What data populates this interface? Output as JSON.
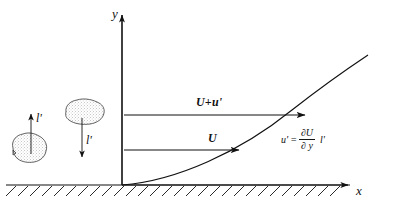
{
  "figure": {
    "background_color": "#ffffff",
    "line_color": "#111111",
    "axes": {
      "y_label": "y",
      "x_label": "x",
      "origin": {
        "x": 122,
        "y": 185
      },
      "y_axis_top": {
        "x": 122,
        "y": 13
      },
      "x_axis_right": {
        "x": 350,
        "y": 185
      }
    },
    "ground": {
      "name": "hatched-wall",
      "line_y": 185,
      "line_x_start": 6,
      "line_x_end": 350,
      "hatch_count": 28,
      "hatch_angle_label": "45"
    },
    "velocity_profile": {
      "name": "velocity-profile-curve",
      "description": "parabolic boundary layer velocity profile rising from origin",
      "start": {
        "x": 122,
        "y": 185
      },
      "end": {
        "x": 368,
        "y": 55
      }
    },
    "arrows": [
      {
        "id": "upper",
        "name": "velocity-vector-upper",
        "label": "U+u'",
        "start": {
          "x": 124,
          "y": 115
        },
        "end": {
          "x": 306,
          "y": 115
        },
        "label_position": {
          "x": 196,
          "y": 96
        }
      },
      {
        "id": "lower",
        "name": "velocity-vector-lower",
        "label": "U",
        "start": {
          "x": 124,
          "y": 150
        },
        "end": {
          "x": 240,
          "y": 150
        },
        "label_position": {
          "x": 208,
          "y": 132
        }
      }
    ],
    "formula": {
      "name": "fluctuation-formula",
      "lhs": "u'",
      "equals": "=",
      "numerator": "∂U",
      "denominator": "∂ y",
      "trailing": "l'",
      "full_text": "u' = ∂U/∂y  l'"
    },
    "eddies": [
      {
        "id": "left",
        "name": "fluid-eddy-blob-upward",
        "label": "l'",
        "arrow_direction": "up",
        "blob_center": {
          "x": 30,
          "y": 148
        },
        "arrow_start": {
          "x": 31,
          "y": 152
        },
        "arrow_end": {
          "x": 31,
          "y": 113
        },
        "label_position": {
          "x": 36,
          "y": 112
        }
      },
      {
        "id": "right",
        "name": "fluid-eddy-blob-downward",
        "label": "l'",
        "arrow_direction": "down",
        "blob_center": {
          "x": 84,
          "y": 113
        },
        "arrow_start": {
          "x": 82,
          "y": 115
        },
        "arrow_end": {
          "x": 82,
          "y": 158
        },
        "label_position": {
          "x": 86,
          "y": 134
        }
      }
    ]
  }
}
